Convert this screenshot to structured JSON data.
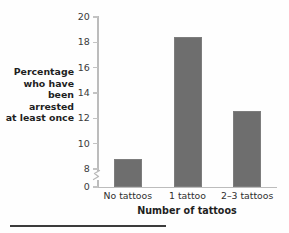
{
  "chart_data": {
    "type": "bar",
    "title": "",
    "categories": [
      "No tattoos",
      "1 tattoo",
      "2–3 tattoos"
    ],
    "values": [
      8.8,
      18.4,
      12.6
    ],
    "xlabel": "Number of tattoos",
    "ylabel": "Percentage who have been arrested at least once",
    "ylabel_lines": [
      "Percentage",
      "who have",
      "been arrested",
      "at least once"
    ],
    "ylim": [
      0,
      20
    ],
    "yticks": [
      0,
      8,
      10,
      12,
      14,
      16,
      18,
      20
    ],
    "ytick_labels": [
      "0",
      "8",
      "10",
      "12",
      "14",
      "16",
      "18",
      "20"
    ],
    "axis_break": true,
    "axis_break_between": [
      0,
      8
    ],
    "grid": false,
    "legend": null,
    "bar_color": "#6e6e6e",
    "axis_color": "#bcbcbc",
    "background_color": "#ffffff"
  },
  "figure": {
    "footer_rule_visible": true
  }
}
